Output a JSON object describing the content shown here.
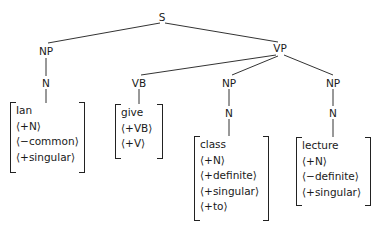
{
  "diagram": {
    "type": "parse-tree",
    "nodes": {
      "s": "S",
      "np_subj": "NP",
      "n_subj": "N",
      "vp": "VP",
      "vb": "VB",
      "np_obj1": "NP",
      "n_obj1": "N",
      "np_obj2": "NP",
      "n_obj2": "N"
    },
    "lexical_entries": [
      {
        "word": "Ian",
        "features": [
          "⟨+N⟩",
          "⟨−common⟩",
          "⟨+singular⟩"
        ]
      },
      {
        "word": "give",
        "features": [
          "⟨+VB⟩",
          "⟨+V⟩"
        ]
      },
      {
        "word": "class",
        "features": [
          "⟨+N⟩",
          "⟨+definite⟩",
          "⟨+singular⟩",
          "⟨+to⟩"
        ]
      },
      {
        "word": "lecture",
        "features": [
          "⟨+N⟩",
          "⟨−definite⟩",
          "⟨+singular⟩"
        ]
      }
    ],
    "edges": [
      [
        "S",
        "NP"
      ],
      [
        "S",
        "VP"
      ],
      [
        "NP",
        "N"
      ],
      [
        "N",
        "Ian"
      ],
      [
        "VP",
        "VB"
      ],
      [
        "VP",
        "NP"
      ],
      [
        "VP",
        "NP"
      ],
      [
        "VB",
        "give"
      ],
      [
        "NP",
        "N"
      ],
      [
        "N",
        "class"
      ],
      [
        "NP",
        "N"
      ],
      [
        "N",
        "lecture"
      ]
    ]
  }
}
